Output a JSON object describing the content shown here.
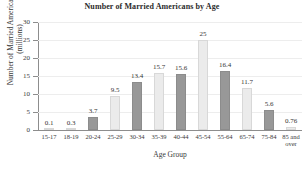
{
  "chart_data": {
    "type": "bar",
    "title": "Number of Married Americans by Age",
    "xlabel": "Age Group",
    "ylabel_line1": "Number of Married Americans",
    "ylabel_line2": "(millions)",
    "categories": [
      "15-17",
      "18-19",
      "20-24",
      "25-29",
      "30-34",
      "35-39",
      "40-44",
      "45-54",
      "55-64",
      "65-74",
      "75-84",
      "85 and\nover"
    ],
    "values": [
      0.1,
      0.3,
      3.7,
      9.5,
      13.4,
      15.7,
      15.6,
      25,
      16.4,
      11.7,
      5.6,
      0.76
    ],
    "value_labels": [
      "0.1",
      "0.3",
      "3.7",
      "9.5",
      "13.4",
      "15.7",
      "15.6",
      "25",
      "16.4",
      "11.7",
      "5.6",
      "0.76"
    ],
    "bar_shades": [
      "light",
      "light",
      "dark",
      "light",
      "dark",
      "light",
      "dark",
      "light",
      "dark",
      "light",
      "dark",
      "light"
    ],
    "ylim": [
      0,
      30
    ],
    "yticks": [
      0,
      5,
      10,
      15,
      20,
      25,
      30
    ],
    "ytick_labels": [
      "0",
      "5",
      "10",
      "15",
      "20",
      "25",
      "30"
    ],
    "grid": true,
    "legend": false,
    "colors": {
      "dark_bar": "#989898",
      "light_bar": "#ebebeb",
      "dark_bar_border": "#8c8c8c",
      "light_bar_border": "#d8d8d8",
      "axis": "#8d8d8d",
      "gridline": "#ededed",
      "text": "#3a3a3a",
      "background": "#ffffff"
    }
  }
}
